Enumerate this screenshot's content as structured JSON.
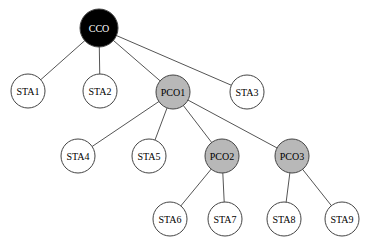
{
  "diagram": {
    "type": "tree",
    "nodes": [
      {
        "id": "CCO",
        "label": "CCO",
        "role": "root",
        "fill": "#000000",
        "text": "#ffffff",
        "x": 99,
        "y": 28,
        "r": 19
      },
      {
        "id": "STA1",
        "label": "STA1",
        "role": "station",
        "fill": "#ffffff",
        "text": "#000000",
        "x": 28,
        "y": 91,
        "r": 17
      },
      {
        "id": "STA2",
        "label": "STA2",
        "role": "station",
        "fill": "#ffffff",
        "text": "#000000",
        "x": 100,
        "y": 91,
        "r": 17
      },
      {
        "id": "PCO1",
        "label": "PCO1",
        "role": "coordinator",
        "fill": "#b8b8b8",
        "text": "#000000",
        "x": 173,
        "y": 92,
        "r": 17
      },
      {
        "id": "STA3",
        "label": "STA3",
        "role": "station",
        "fill": "#ffffff",
        "text": "#000000",
        "x": 247,
        "y": 92,
        "r": 17
      },
      {
        "id": "STA4",
        "label": "STA4",
        "role": "station",
        "fill": "#ffffff",
        "text": "#000000",
        "x": 78,
        "y": 156,
        "r": 17
      },
      {
        "id": "STA5",
        "label": "STA5",
        "role": "station",
        "fill": "#ffffff",
        "text": "#000000",
        "x": 149,
        "y": 156,
        "r": 17
      },
      {
        "id": "PCO2",
        "label": "PCO2",
        "role": "coordinator",
        "fill": "#b8b8b8",
        "text": "#000000",
        "x": 222,
        "y": 156,
        "r": 17
      },
      {
        "id": "PCO3",
        "label": "PCO3",
        "role": "coordinator",
        "fill": "#b8b8b8",
        "text": "#000000",
        "x": 292,
        "y": 156,
        "r": 17
      },
      {
        "id": "STA6",
        "label": "STA6",
        "role": "station",
        "fill": "#ffffff",
        "text": "#000000",
        "x": 170,
        "y": 219,
        "r": 17
      },
      {
        "id": "STA7",
        "label": "STA7",
        "role": "station",
        "fill": "#ffffff",
        "text": "#000000",
        "x": 225,
        "y": 219,
        "r": 17
      },
      {
        "id": "STA8",
        "label": "STA8",
        "role": "station",
        "fill": "#ffffff",
        "text": "#000000",
        "x": 284,
        "y": 219,
        "r": 17
      },
      {
        "id": "STA9",
        "label": "STA9",
        "role": "station",
        "fill": "#ffffff",
        "text": "#000000",
        "x": 342,
        "y": 219,
        "r": 17
      }
    ],
    "edges": [
      [
        "CCO",
        "STA1"
      ],
      [
        "CCO",
        "STA2"
      ],
      [
        "CCO",
        "PCO1"
      ],
      [
        "CCO",
        "STA3"
      ],
      [
        "PCO1",
        "STA4"
      ],
      [
        "PCO1",
        "STA5"
      ],
      [
        "PCO1",
        "PCO2"
      ],
      [
        "PCO1",
        "PCO3"
      ],
      [
        "PCO2",
        "STA6"
      ],
      [
        "PCO2",
        "STA7"
      ],
      [
        "PCO3",
        "STA8"
      ],
      [
        "PCO3",
        "STA9"
      ]
    ]
  }
}
